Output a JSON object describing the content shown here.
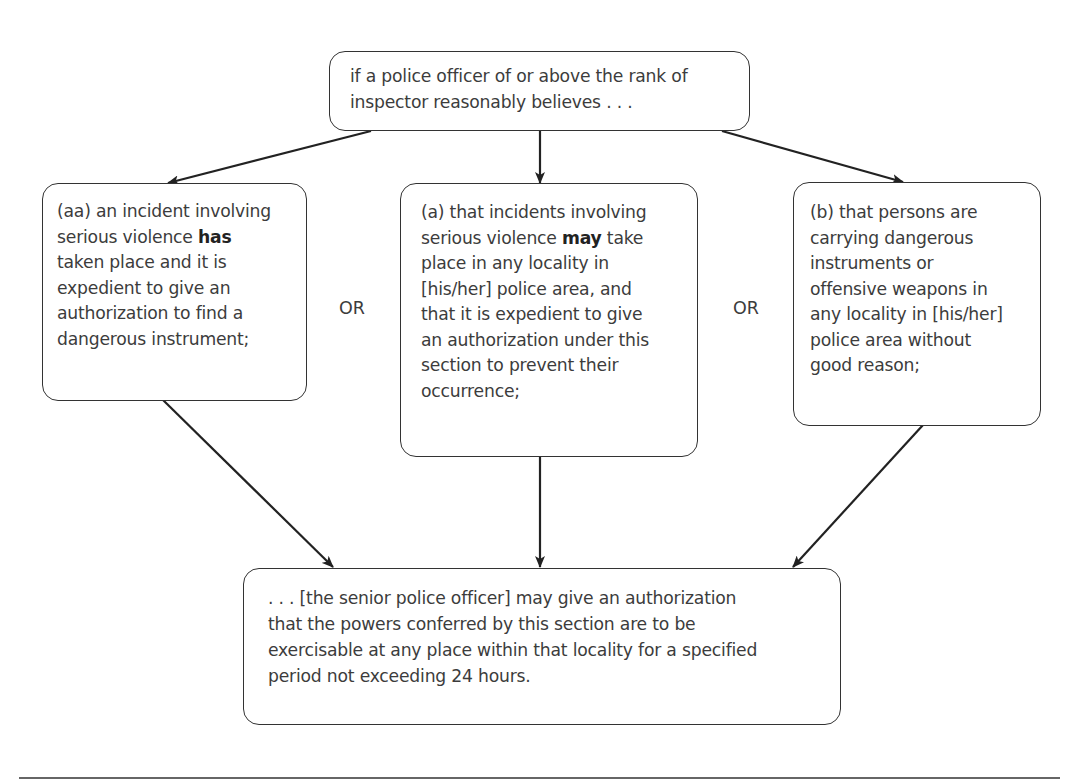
{
  "diagram": {
    "top": {
      "lines": [
        "if a police officer of or above the rank of",
        "inspector reasonably believes . . ."
      ]
    },
    "left": {
      "lines_pre": "(aa) an incident involving",
      "line2_pre": "serious violence ",
      "line2_bold": "has",
      "rest": [
        "taken place and it is",
        "expedient to give an",
        "authorization to find a",
        "dangerous instrument;"
      ]
    },
    "middle": {
      "line1": "(a) that incidents involving",
      "line2_pre": "serious violence ",
      "line2_bold": "may",
      "line2_post": " take",
      "rest": [
        "place in any locality in",
        "[his/her] police area, and",
        "that it is expedient to give",
        "an authorization under this",
        "section to prevent their",
        "occurrence;"
      ]
    },
    "right": {
      "lines": [
        "(b) that persons are",
        "carrying dangerous",
        "instruments or",
        "offensive weapons in",
        "any locality in [his/her]",
        "police area without",
        "good reason;"
      ]
    },
    "bottom": {
      "lines": [
        ". . . [the senior police officer] may give an authorization",
        "that the powers conferred by this section are to be",
        "exercisable at any place within that locality for a specified",
        "period not exceeding 24 hours."
      ]
    },
    "connectors": {
      "left_or": "OR",
      "right_or": "OR"
    },
    "colors": {
      "stroke": "#333333",
      "text": "#3c3c3c",
      "background": "#ffffff"
    }
  }
}
